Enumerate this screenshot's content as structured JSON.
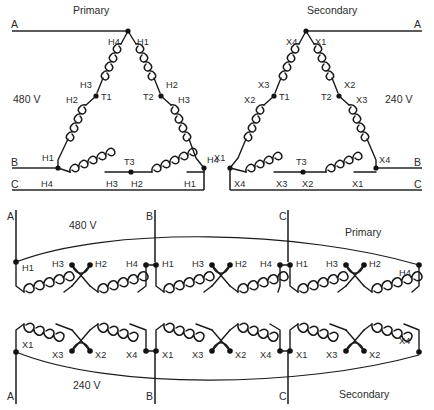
{
  "figure": {
    "type": "electrical-wiring-diagram",
    "background_color": "#ffffff",
    "line_color": "#1a1a1a"
  },
  "top_left_delta": {
    "title": "Primary",
    "voltage": "480 V",
    "phase_lines": [
      "A",
      "B",
      "C"
    ],
    "junction_labels": [
      "T1",
      "T2",
      "T3"
    ],
    "terminals": {
      "apex_left": "H4",
      "apex_right": "H1",
      "left_leg_upper": "H3",
      "left_leg_lower": "H2",
      "right_leg_upper": "H2",
      "right_leg_lower": "H3",
      "bottom_left_upper": "H1",
      "bottom_left_lower": "H4",
      "bottom_mid_left": "H3",
      "bottom_mid_right": "H2",
      "bottom_right_lower": "H1",
      "bottom_right_upper": "H4"
    }
  },
  "top_right_delta": {
    "title": "Secondary",
    "voltage": "240 V",
    "phase_lines": [
      "A",
      "B",
      "C"
    ],
    "junction_labels": [
      "T1",
      "T2",
      "T3"
    ],
    "terminals": {
      "apex_left": "X4",
      "apex_right": "X1",
      "left_leg_upper": "X3",
      "left_leg_lower": "X2",
      "right_leg_upper": "X2",
      "right_leg_lower": "X3",
      "bottom_left_upper": "X1",
      "bottom_left_lower": "X4",
      "bottom_mid_left": "X3",
      "bottom_mid_right": "X2",
      "bottom_right_lower": "X1",
      "bottom_right_upper": "X4"
    }
  },
  "lower_schematic": {
    "primary": {
      "title": "Primary",
      "voltage": "480 V",
      "phase_lines_top": [
        "A",
        "B",
        "C"
      ],
      "groups": [
        {
          "left": "H1",
          "mid_left": "H3",
          "mid_right": "H2",
          "right": "H4"
        },
        {
          "left": "H1",
          "mid_left": "H3",
          "mid_right": "H2",
          "right": "H4"
        },
        {
          "left": "H1",
          "mid_left": "H3",
          "mid_right": "H2",
          "right": "H4"
        }
      ]
    },
    "secondary": {
      "title": "Secondary",
      "voltage": "240 V",
      "phase_lines_bottom": [
        "A",
        "B",
        "C"
      ],
      "groups": [
        {
          "left": "X1",
          "mid_left": "X3",
          "mid_right": "X2",
          "right": "X4"
        },
        {
          "left": "X1",
          "mid_left": "X3",
          "mid_right": "X2",
          "right": "X4"
        },
        {
          "left": "X1",
          "mid_left": "X3",
          "mid_right": "X2",
          "right": "X4"
        }
      ]
    }
  }
}
